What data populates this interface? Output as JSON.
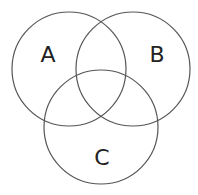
{
  "diagram": {
    "type": "venn",
    "sets": [
      {
        "label": "A",
        "cx": 69,
        "cy": 69,
        "r": 57
      },
      {
        "label": "B",
        "cx": 133,
        "cy": 69,
        "r": 57
      },
      {
        "label": "C",
        "cx": 101,
        "cy": 127,
        "r": 57
      }
    ],
    "colors": {
      "stroke": "#555555",
      "text": "#222222",
      "background": "#ffffff"
    }
  }
}
